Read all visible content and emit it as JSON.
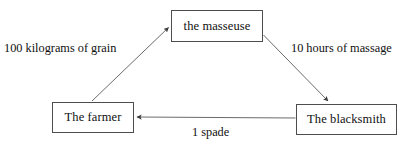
{
  "diagram": {
    "background_color": "#ffffff",
    "stroke_color": "#4d4d4d",
    "text_color": "#101010",
    "nodes": [
      {
        "id": "masseuse",
        "label": "the masseuse"
      },
      {
        "id": "farmer",
        "label": "The farmer"
      },
      {
        "id": "blacksmith",
        "label": "The blacksmith"
      }
    ],
    "edges": [
      {
        "id": "grain",
        "from": "farmer",
        "to": "masseuse",
        "label": "100 kilograms of grain"
      },
      {
        "id": "massage",
        "from": "masseuse",
        "to": "blacksmith",
        "label": "10 hours of massage"
      },
      {
        "id": "spade",
        "from": "blacksmith",
        "to": "farmer",
        "label": "1 spade"
      }
    ]
  }
}
